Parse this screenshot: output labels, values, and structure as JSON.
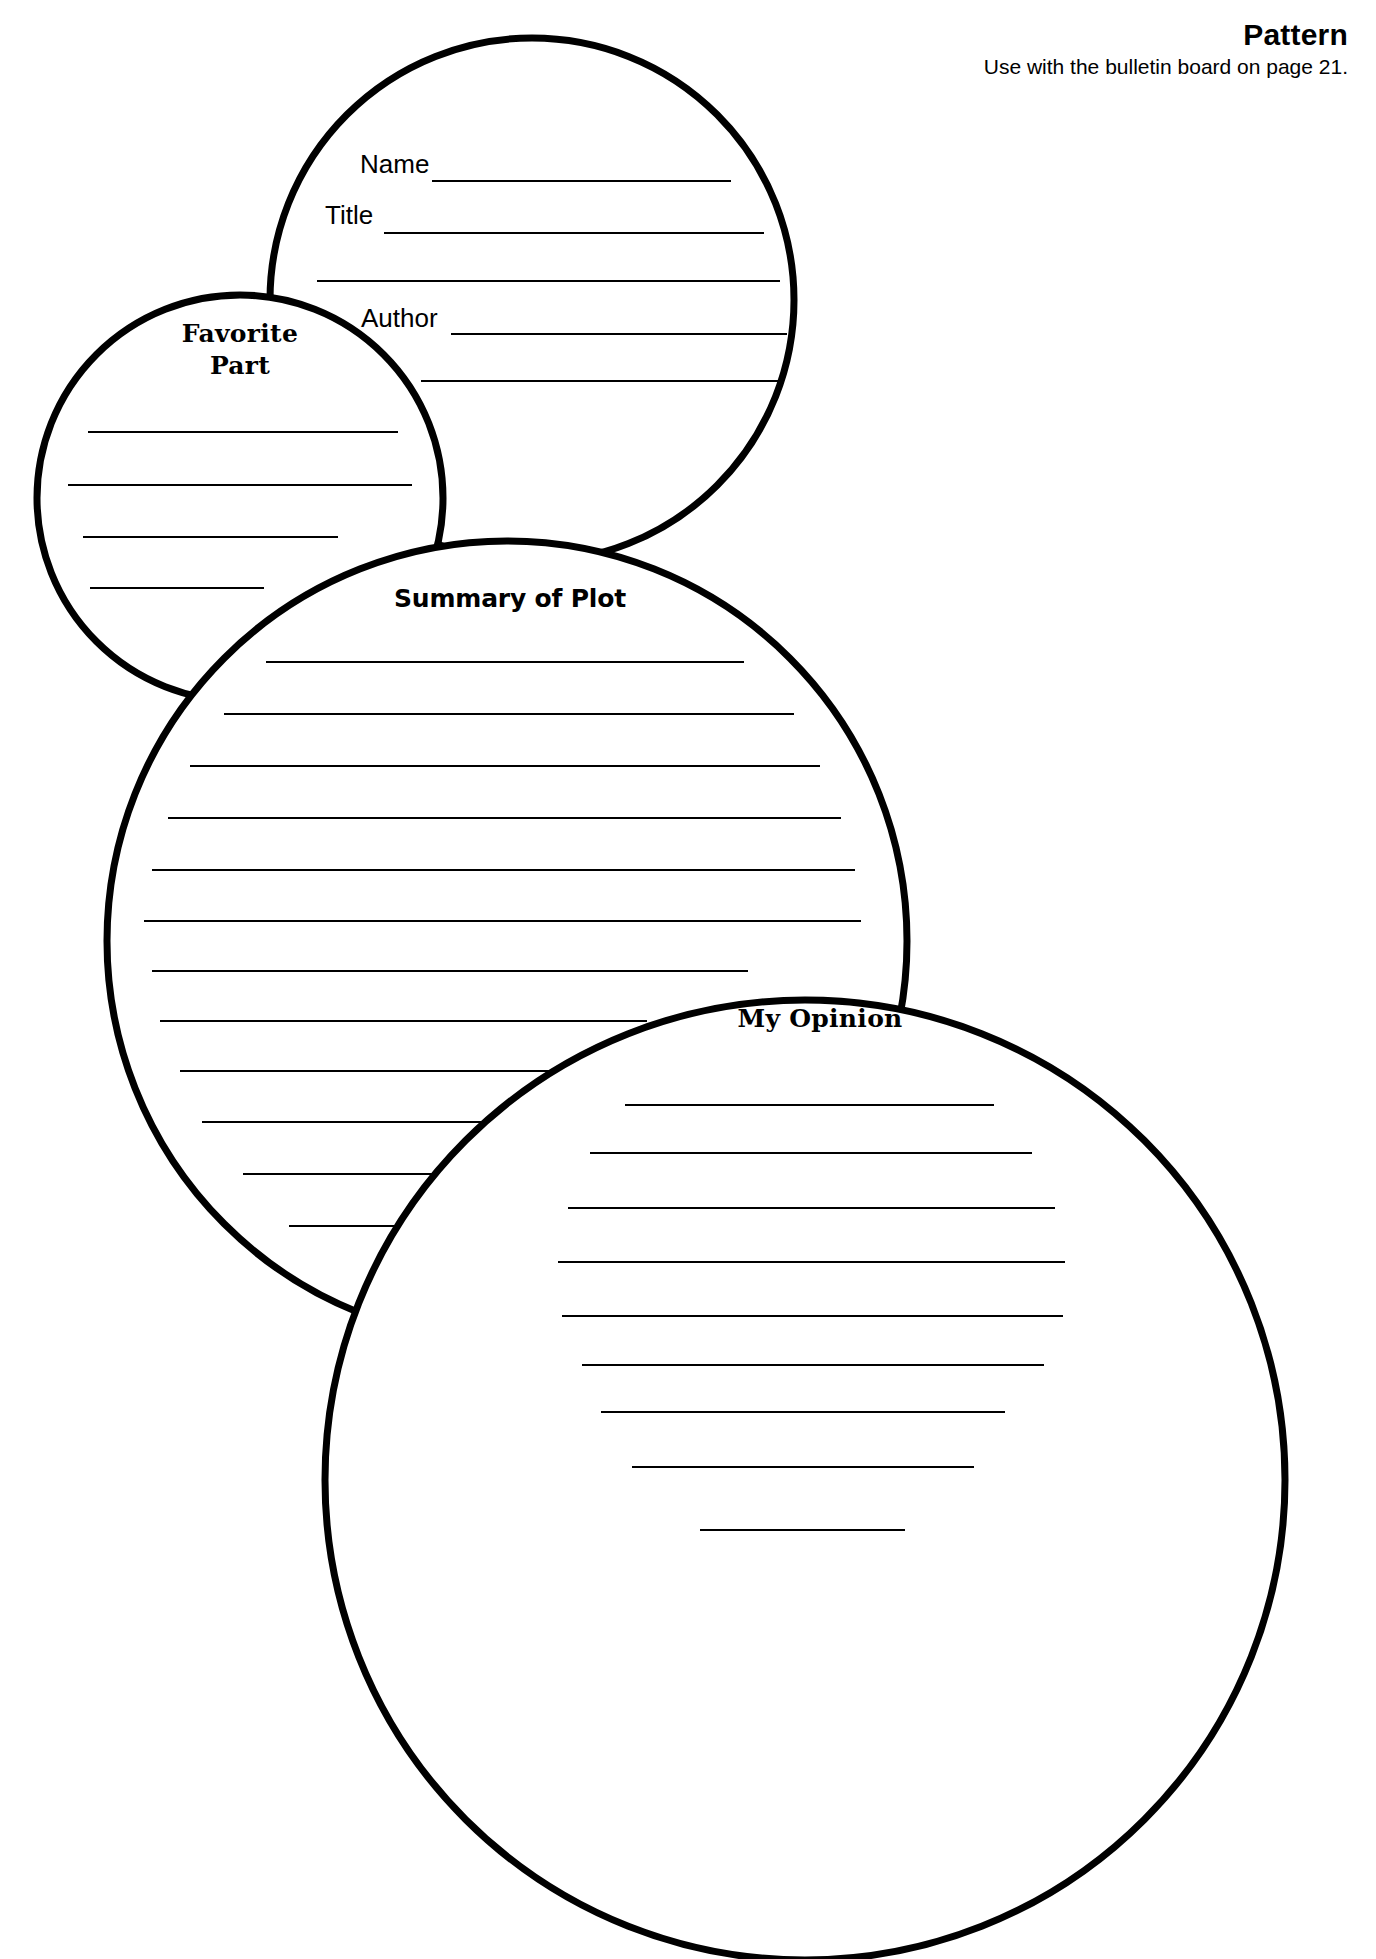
{
  "page": {
    "width": 1376,
    "height": 1959,
    "background": "#ffffff",
    "ink": "#000000"
  },
  "header": {
    "title": "Pattern",
    "subtitle": "Use with the bulletin board on page 21."
  },
  "circles": [
    {
      "id": "book-info",
      "name": "book-info-circle",
      "label": "",
      "cx": 532,
      "cy": 300,
      "r": 262,
      "stroke_width": 7,
      "fields": [
        {
          "id": "name",
          "label": "Name"
        },
        {
          "id": "title",
          "label": "Title"
        },
        {
          "id": "author",
          "label": "Author"
        }
      ],
      "write_lines": [
        {
          "x1": 432,
          "x2": 731,
          "y": 181
        },
        {
          "x1": 384,
          "x2": 764,
          "y": 233
        },
        {
          "x1": 317,
          "x2": 780,
          "y": 281
        },
        {
          "x1": 451,
          "x2": 787,
          "y": 334
        },
        {
          "x1": 421,
          "x2": 778,
          "y": 381
        }
      ]
    },
    {
      "id": "favorite-part",
      "name": "favorite-part-circle",
      "label": "Favorite\nPart",
      "cx": 240,
      "cy": 498,
      "r": 203,
      "stroke_width": 7,
      "write_lines": [
        {
          "x1": 88,
          "x2": 398,
          "y": 432
        },
        {
          "x1": 68,
          "x2": 412,
          "y": 485
        },
        {
          "x1": 83,
          "x2": 338,
          "y": 537
        },
        {
          "x1": 90,
          "x2": 264,
          "y": 588
        }
      ]
    },
    {
      "id": "summary-of-plot",
      "name": "summary-of-plot-circle",
      "label": "Summary of Plot",
      "cx": 507,
      "cy": 941,
      "r": 400,
      "stroke_width": 7,
      "write_lines": [
        {
          "x1": 266,
          "x2": 744,
          "y": 662
        },
        {
          "x1": 224,
          "x2": 794,
          "y": 714
        },
        {
          "x1": 190,
          "x2": 820,
          "y": 766
        },
        {
          "x1": 168,
          "x2": 841,
          "y": 818
        },
        {
          "x1": 152,
          "x2": 855,
          "y": 870
        },
        {
          "x1": 144,
          "x2": 861,
          "y": 921
        },
        {
          "x1": 152,
          "x2": 748,
          "y": 971
        },
        {
          "x1": 160,
          "x2": 647,
          "y": 1021
        },
        {
          "x1": 180,
          "x2": 600,
          "y": 1071
        },
        {
          "x1": 202,
          "x2": 545,
          "y": 1122
        },
        {
          "x1": 243,
          "x2": 506,
          "y": 1174
        },
        {
          "x1": 289,
          "x2": 517,
          "y": 1226
        },
        {
          "x1": 375,
          "x2": 512,
          "y": 1277
        }
      ]
    },
    {
      "id": "my-opinion",
      "name": "my-opinion-circle",
      "label": "My Opinion",
      "cx": 805,
      "cy": 1480,
      "r": 480,
      "stroke_width": 7,
      "write_lines": [
        {
          "x1": 625,
          "x2": 994,
          "y": 1105
        },
        {
          "x1": 590,
          "x2": 1032,
          "y": 1153
        },
        {
          "x1": 568,
          "x2": 1055,
          "y": 1208
        },
        {
          "x1": 558,
          "x2": 1065,
          "y": 1262
        },
        {
          "x1": 562,
          "x2": 1063,
          "y": 1316
        },
        {
          "x1": 582,
          "x2": 1044,
          "y": 1365
        },
        {
          "x1": 601,
          "x2": 1005,
          "y": 1412
        },
        {
          "x1": 632,
          "x2": 974,
          "y": 1467
        },
        {
          "x1": 700,
          "x2": 905,
          "y": 1530
        }
      ]
    }
  ]
}
